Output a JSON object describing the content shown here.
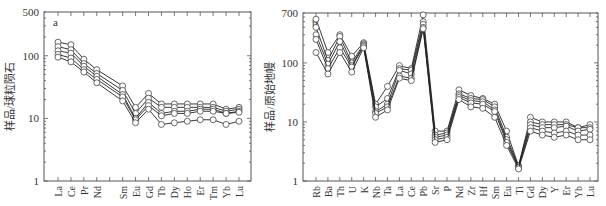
{
  "chart_data": [
    {
      "type": "line",
      "panel_label": "a",
      "title": "",
      "xlabel": "",
      "ylabel": "样品/球粒陨石",
      "yscale": "log",
      "ylim": [
        1,
        500
      ],
      "yticks": [
        1,
        10,
        100,
        500
      ],
      "categories": [
        "La",
        "Ce",
        "Pr",
        "Nd",
        "",
        "Sm",
        "Eu",
        "Gd",
        "Tb",
        "Dy",
        "Ho",
        "Er",
        "Tm",
        "Yb",
        "Lu"
      ],
      "series": [
        {
          "name": "sample-1",
          "values": [
            165,
            150,
            88,
            60,
            null,
            33,
            15,
            25,
            17,
            17,
            17,
            17,
            17,
            14,
            15
          ]
        },
        {
          "name": "sample-2",
          "values": [
            140,
            125,
            75,
            52,
            null,
            28,
            12,
            21,
            15,
            15,
            15,
            15,
            15,
            13,
            14
          ]
        },
        {
          "name": "sample-3",
          "values": [
            120,
            110,
            68,
            47,
            null,
            24,
            10,
            18,
            12,
            13,
            13,
            14,
            14,
            12,
            13
          ]
        },
        {
          "name": "sample-4",
          "values": [
            105,
            92,
            60,
            42,
            null,
            22,
            9.5,
            16,
            11,
            12,
            12,
            13,
            13,
            12,
            12.5
          ]
        },
        {
          "name": "sample-5",
          "values": [
            95,
            80,
            55,
            37,
            null,
            19,
            8.5,
            14,
            8,
            8.5,
            9,
            9.5,
            9.5,
            8,
            9
          ]
        }
      ],
      "grid": false,
      "legend": null
    },
    {
      "type": "line",
      "panel_label": "b",
      "title": "",
      "xlabel": "",
      "ylabel": "样品/原始地幔",
      "yscale": "log",
      "ylim": [
        1,
        700
      ],
      "yticks": [
        1,
        10,
        100,
        700
      ],
      "categories": [
        "Rb",
        "Ba",
        "Th",
        "U",
        "K",
        "Nb",
        "Ta",
        "La",
        "Ce",
        "Pb",
        "Sr",
        "P",
        "Nd",
        "Zr",
        "Hf",
        "Sm",
        "Eu",
        "Ti",
        "Gd",
        "Dy",
        "Y",
        "Er",
        "Yb",
        "Lu"
      ],
      "series": [
        {
          "name": "sample-1",
          "values": [
            550,
            150,
            300,
            130,
            220,
            20,
            40,
            90,
            80,
            650,
            7,
            7,
            35,
            28,
            25,
            20,
            7,
            1.8,
            12,
            10,
            10,
            10,
            8,
            9
          ]
        },
        {
          "name": "sample-2",
          "values": [
            400,
            110,
            280,
            100,
            210,
            18,
            25,
            80,
            75,
            500,
            6,
            6.5,
            30,
            25,
            24,
            18,
            5.5,
            1.8,
            10,
            9,
            9,
            9,
            8,
            8
          ]
        },
        {
          "name": "sample-3",
          "values": [
            300,
            95,
            230,
            90,
            200,
            15,
            20,
            75,
            65,
            450,
            5.5,
            6,
            28,
            23,
            22,
            16,
            5,
            1.7,
            9,
            8,
            8,
            8.5,
            7,
            7.5
          ]
        },
        {
          "name": "sample-4",
          "values": [
            250,
            80,
            180,
            85,
            190,
            14,
            18,
            60,
            55,
            400,
            5,
            5.5,
            26,
            21,
            20,
            15,
            4.5,
            1.7,
            8,
            7,
            6.5,
            7,
            6,
            6
          ]
        },
        {
          "name": "sample-5",
          "values": [
            150,
            65,
            150,
            70,
            180,
            12,
            16,
            55,
            50,
            380,
            4.5,
            5,
            24,
            18,
            17,
            12,
            4,
            1.6,
            7,
            6,
            5.5,
            6,
            5,
            5
          ]
        }
      ],
      "grid": false,
      "legend": null
    }
  ]
}
